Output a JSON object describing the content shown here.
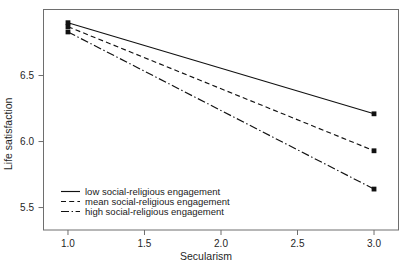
{
  "chart_data": {
    "type": "line",
    "title": "",
    "subtitle": "",
    "xlabel": "Secularism",
    "ylabel": "Life satisfaction",
    "xlim": [
      0.84,
      3.16
    ],
    "ylim": [
      5.33,
      7.0
    ],
    "xticks": [
      "1.0",
      "1.5",
      "2.0",
      "2.5",
      "3.0"
    ],
    "xtick_values": [
      1.0,
      1.5,
      2.0,
      2.5,
      3.0
    ],
    "yticks": [
      "5.5",
      "6.0",
      "6.5"
    ],
    "ytick_values": [
      5.5,
      6.0,
      6.5
    ],
    "grid": false,
    "legend_position": "bottom-left inside axes",
    "x": [
      1.0,
      3.0
    ],
    "series": [
      {
        "name": "low social-religious engagement",
        "style": "solid",
        "marker": "filled-square",
        "color": "#111111",
        "values": [
          6.9,
          6.21
        ]
      },
      {
        "name": "mean social-religious engagement",
        "style": "dashed",
        "marker": "filled-square",
        "color": "#111111",
        "values": [
          6.87,
          5.93
        ]
      },
      {
        "name": "high social-religious engagement",
        "style": "dash-dot",
        "marker": "filled-square",
        "color": "#111111",
        "values": [
          6.83,
          5.64
        ]
      }
    ]
  },
  "legend": {
    "entries": [
      {
        "label": "low social-religious engagement",
        "style": "solid"
      },
      {
        "label": "mean social-religious engagement",
        "style": "dashed"
      },
      {
        "label": "high social-religious engagement",
        "style": "dash-dot"
      }
    ]
  },
  "colors": {
    "axis": "#6e6e6e",
    "ink": "#111111",
    "background": "#ffffff"
  }
}
